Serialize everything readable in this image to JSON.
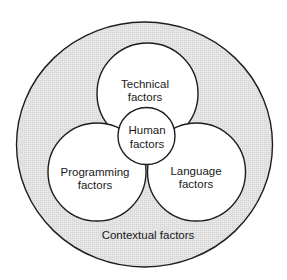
{
  "diagram": {
    "type": "nested-venn",
    "colors": {
      "background": "#ffffff",
      "ring_fill": "#e4e4e4",
      "ring_dot": "#cfcfcf",
      "inner_fill": "#ffffff",
      "stroke": "#1e1e1e",
      "text": "#1a1a1a"
    },
    "outer": {
      "label": "Contextual factors"
    },
    "circles": [
      {
        "id": "technical",
        "line1": "Technical",
        "line2": "factors"
      },
      {
        "id": "programming",
        "line1": "Programming",
        "line2": "factors"
      },
      {
        "id": "language",
        "line1": "Language",
        "line2": "factors"
      },
      {
        "id": "human",
        "line1": "Human",
        "line2": "factors"
      }
    ]
  }
}
